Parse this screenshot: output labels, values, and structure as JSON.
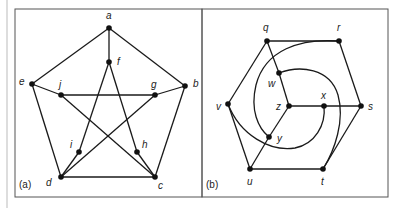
{
  "figure": {
    "panels": [
      {
        "id": "a",
        "label": "(a)",
        "nodes": [
          {
            "id": "a",
            "label": "a"
          },
          {
            "id": "b",
            "label": "b"
          },
          {
            "id": "c",
            "label": "c"
          },
          {
            "id": "d",
            "label": "d"
          },
          {
            "id": "e",
            "label": "e"
          },
          {
            "id": "f",
            "label": "f"
          },
          {
            "id": "g",
            "label": "g"
          },
          {
            "id": "h",
            "label": "h"
          },
          {
            "id": "i",
            "label": "i"
          },
          {
            "id": "j",
            "label": "j"
          }
        ],
        "edges": [
          [
            "a",
            "b"
          ],
          [
            "b",
            "c"
          ],
          [
            "c",
            "d"
          ],
          [
            "d",
            "e"
          ],
          [
            "e",
            "a"
          ],
          [
            "a",
            "f"
          ],
          [
            "b",
            "g"
          ],
          [
            "c",
            "h"
          ],
          [
            "d",
            "i"
          ],
          [
            "e",
            "j"
          ],
          [
            "f",
            "h"
          ],
          [
            "h",
            "j"
          ],
          [
            "j",
            "g"
          ],
          [
            "g",
            "i"
          ],
          [
            "i",
            "f"
          ]
        ]
      },
      {
        "id": "b",
        "label": "(b)",
        "nodes": [
          {
            "id": "q",
            "label": "q"
          },
          {
            "id": "r",
            "label": "r"
          },
          {
            "id": "s",
            "label": "s"
          },
          {
            "id": "t",
            "label": "t"
          },
          {
            "id": "u",
            "label": "u"
          },
          {
            "id": "v",
            "label": "v"
          },
          {
            "id": "w",
            "label": "w"
          },
          {
            "id": "x",
            "label": "x"
          },
          {
            "id": "y",
            "label": "y"
          },
          {
            "id": "z",
            "label": "z"
          }
        ],
        "edges": [
          [
            "q",
            "r"
          ],
          [
            "r",
            "s"
          ],
          [
            "s",
            "t"
          ],
          [
            "t",
            "u"
          ],
          [
            "u",
            "v"
          ],
          [
            "v",
            "q"
          ],
          [
            "q",
            "w"
          ],
          [
            "w",
            "z"
          ],
          [
            "z",
            "x"
          ],
          [
            "x",
            "s"
          ],
          [
            "z",
            "y"
          ],
          [
            "y",
            "u"
          ],
          [
            "w",
            "t",
            "curved"
          ],
          [
            "r",
            "y",
            "curved"
          ],
          [
            "v",
            "x",
            "curved"
          ]
        ]
      }
    ]
  }
}
